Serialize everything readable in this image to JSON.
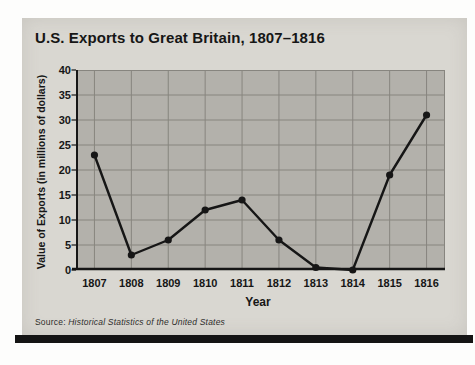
{
  "panel": {
    "title": "U.S. Exports to Great Britain, 1807–1816"
  },
  "source": {
    "prefix": "Source: ",
    "citation": "Historical Statistics of the United States"
  },
  "colors": {
    "panel_bg": "#d9d7d1",
    "plot_bg": "#b3b1ab",
    "grid": "#87857f",
    "ink": "#161616",
    "bottom_bar": "#141414"
  },
  "chart_data": {
    "type": "line",
    "title": "U.S. Exports to Great Britain, 1807–1816",
    "categories": [
      "1807",
      "1808",
      "1809",
      "1810",
      "1811",
      "1812",
      "1813",
      "1814",
      "1815",
      "1816"
    ],
    "values": [
      23,
      3,
      6,
      12,
      14,
      6,
      0.5,
      0,
      19,
      31
    ],
    "xlabel": "Year",
    "ylabel": "Value of Exports (in millions of dollars)",
    "ylim": [
      0,
      40
    ],
    "yticks": [
      0,
      5,
      10,
      15,
      20,
      25,
      30,
      35,
      40
    ],
    "grid": true,
    "legend": false,
    "marker": "filled-circle",
    "line_color": "#161616"
  }
}
